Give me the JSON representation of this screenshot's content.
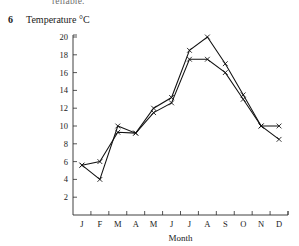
{
  "page": {
    "clipped_header_text": "reliable.",
    "question_number": "6"
  },
  "chart_data": {
    "type": "line",
    "title": "Temperature °C",
    "xlabel": "Month",
    "ylabel": "Temperature °C",
    "categories": [
      "J",
      "F",
      "M",
      "A",
      "M",
      "J",
      "J",
      "A",
      "S",
      "O",
      "N",
      "D"
    ],
    "category_names": [
      "January",
      "February",
      "March",
      "April",
      "May",
      "June",
      "July",
      "August",
      "September",
      "October",
      "November",
      "December"
    ],
    "series": [
      {
        "name": "series-1",
        "values": [
          5.6,
          4.0,
          10.0,
          9.2,
          12.0,
          13.2,
          18.5,
          20.0,
          17.0,
          13.5,
          10.0,
          8.5
        ]
      },
      {
        "name": "series-2",
        "values": [
          5.6,
          6.0,
          9.3,
          9.2,
          11.5,
          12.6,
          17.5,
          17.5,
          16.0,
          13.0,
          10.0,
          10.0
        ]
      }
    ],
    "ylim": [
      0,
      20
    ],
    "yticks": [
      2,
      4,
      6,
      8,
      10,
      12,
      14,
      16,
      18,
      20
    ],
    "ytick_labels": [
      "2",
      "4",
      "6",
      "8",
      "10",
      "12",
      "14",
      "16",
      "18",
      "20"
    ],
    "grid": false,
    "legend": "none",
    "marker": "x"
  }
}
